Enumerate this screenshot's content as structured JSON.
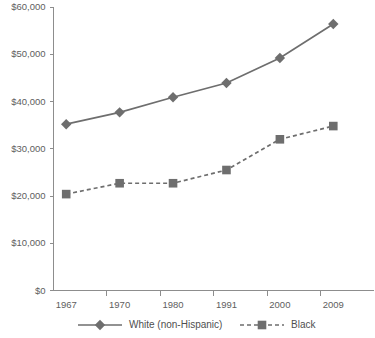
{
  "chart_data": {
    "type": "line",
    "title": "",
    "subtitle": "",
    "xlabel": "",
    "ylabel": "",
    "categories": [
      "1967",
      "1970",
      "1980",
      "1991",
      "2000",
      "2009"
    ],
    "ylim": [
      0,
      60000
    ],
    "ytick_values": [
      0,
      10000,
      20000,
      30000,
      40000,
      50000,
      60000
    ],
    "ytick_labels": [
      "$0",
      "$10,000",
      "$20,000",
      "$30,000",
      "$40,000",
      "$50,000",
      "$60,000"
    ],
    "grid": false,
    "legend_position": "bottom",
    "series": [
      {
        "name": "White (non-Hispanic)",
        "values": [
          35200,
          37700,
          40900,
          43900,
          49200,
          56400
        ],
        "marker": "diamond",
        "line_style": "solid",
        "color": "#6e6e6e"
      },
      {
        "name": "Black",
        "values": [
          20400,
          22700,
          22700,
          25500,
          32000,
          34800
        ],
        "marker": "square",
        "line_style": "dashed",
        "color": "#6e6e6e"
      }
    ]
  },
  "axes": {
    "axis_color": "#8d8d8d",
    "tick_label_color": "#5e5e5e"
  },
  "legend": {
    "items": [
      {
        "label": "White (non-Hispanic)",
        "marker": "diamond",
        "line_style": "solid"
      },
      {
        "label": "Black",
        "marker": "square",
        "line_style": "dashed"
      }
    ]
  }
}
